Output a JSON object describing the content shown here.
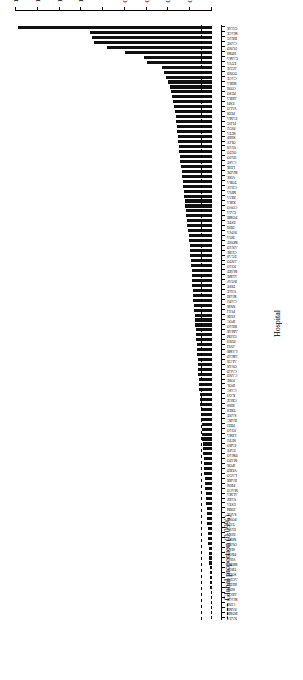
{
  "chart_data": {
    "type": "bar",
    "orientation": "horizontal",
    "title": "",
    "subtitle": "",
    "xlabel": "%",
    "ylabel": "Hospital",
    "xlim": [
      0,
      1.8
    ],
    "x_ticks": [
      "0",
      "0.2",
      "0.4",
      "0.6",
      "0.8",
      "1",
      "1.2",
      "1.4",
      "1.6",
      "1.8"
    ],
    "x_tick_values": [
      0,
      0.2,
      0.4,
      0.6,
      0.8,
      1.0,
      1.2,
      1.4,
      1.6,
      1.8
    ],
    "grid": false,
    "legend_position": "top-left",
    "reference_line": {
      "label": "Global proportion (0.09%)",
      "value": 0.09,
      "style": "dashed",
      "color": "#000000"
    },
    "legend": [
      {
        "label": "Global proportion (0.09%)",
        "style": "dashed",
        "color": "#000000"
      }
    ],
    "bar_color": "#111111",
    "categories": [
      "GUAR",
      "MACE",
      "BRAG",
      "CANT",
      "FUND",
      "HPMI",
      "GAMA",
      "ETVA",
      "AGUE",
      "TOND",
      "CACE",
      "MIRA",
      "CONI",
      "PESO",
      "ABRA",
      "ESPI",
      "VALO",
      "PEDI",
      "FAMA",
      "FLEG",
      "PIGU",
      "SETA",
      "SERP",
      "OLIV",
      "VIAN",
      "OLTO",
      "HUJO",
      "CAST",
      "LEIR",
      "MADE",
      "VISE",
      "TORA",
      "CHAV",
      "MFIA",
      "BEJA",
      "XIRA",
      "COVO",
      "GAIA",
      "POMB",
      "ESTE",
      "DINI",
      "NOVA",
      "BOA",
      "MONT",
      "ANAD",
      "CUBE",
      "EGAS",
      "ANTO",
      "JOAO",
      "MART",
      "ALME",
      "BOAV",
      "DIST",
      "VALE",
      "MARI",
      "CAPU",
      "SNIR",
      "PULI",
      "FEIR",
      "IPOC",
      "BRAO",
      "AMAR",
      "GUIM",
      "PINH",
      "AVEI",
      "LAMB",
      "AMAD",
      "ALCB",
      "OVAR",
      "CALD",
      "CAND",
      "JOSE",
      "IPOL",
      "CASC",
      "XAVI",
      "CRUZ",
      "BISS",
      "TRES",
      "SANT",
      "BARC",
      "PREI",
      "JOAO2",
      "LIMA",
      "SETU",
      "FARO",
      "FAFE",
      "PMAO",
      "MATO",
      "IPOR",
      "VERD",
      "LAGO",
      "BARR",
      "PBNI",
      "MACO",
      "ALMA",
      "VARZ",
      "ESTA",
      "HBM",
      "SAGR",
      "PONT",
      "TAVI",
      "ELVA",
      "NISA",
      "MOIT",
      "OURE",
      "SEIA",
      "PROE",
      "VILA",
      "MEDA",
      "TROF",
      "SOUR",
      "AGUD",
      "REDO",
      "SINE",
      "ARCO",
      "MACE2",
      "CINF",
      "PAMP",
      "BOMB",
      "NAZA"
    ],
    "values": [
      1.78,
      1.12,
      1.1,
      1.08,
      0.96,
      0.8,
      0.62,
      0.6,
      0.46,
      0.44,
      0.42,
      0.4,
      0.39,
      0.38,
      0.37,
      0.36,
      0.35,
      0.34,
      0.335,
      0.33,
      0.325,
      0.32,
      0.315,
      0.31,
      0.305,
      0.3,
      0.295,
      0.29,
      0.285,
      0.28,
      0.275,
      0.27,
      0.265,
      0.26,
      0.255,
      0.25,
      0.245,
      0.24,
      0.235,
      0.23,
      0.225,
      0.22,
      0.215,
      0.21,
      0.205,
      0.2,
      0.198,
      0.195,
      0.19,
      0.188,
      0.185,
      0.182,
      0.18,
      0.176,
      0.172,
      0.17,
      0.167,
      0.164,
      0.16,
      0.157,
      0.154,
      0.15,
      0.147,
      0.144,
      0.141,
      0.138,
      0.135,
      0.132,
      0.13,
      0.127,
      0.124,
      0.121,
      0.118,
      0.115,
      0.112,
      0.11,
      0.107,
      0.104,
      0.101,
      0.098,
      0.095,
      0.092,
      0.09,
      0.088,
      0.085,
      0.082,
      0.08,
      0.077,
      0.074,
      0.072,
      0.069,
      0.066,
      0.063,
      0.06,
      0.058,
      0.055,
      0.052,
      0.05,
      0.047,
      0.045,
      0.042,
      0.04,
      0.038,
      0.035,
      0.033,
      0.03,
      0.028,
      0.026,
      0.024,
      0.022,
      0.02,
      0.018,
      0.016,
      0.014,
      0.012,
      0.01,
      0.008,
      0.006,
      0.004,
      0.002
    ],
    "category_labels_visible": [
      "GUAR",
      "MACE",
      "BRAG",
      "CANT",
      "FUND",
      "HPMI",
      "GAMA",
      "ETVA",
      "AGUE",
      "TOND",
      "CACE",
      "MIRA",
      "CONI",
      "PESO",
      "ABRA",
      "ESPI",
      "VALO",
      "PEDI",
      "FAMA",
      "FLEG",
      "PIGU",
      "SETA",
      "SERP",
      "OLIV",
      "VIAN",
      "OLTO",
      "HUJO",
      "CAST",
      "LEIR",
      "MADE",
      "VISE",
      "TORA",
      "CHAV",
      "MFIA",
      "BEJA",
      "XIRA",
      "COVO",
      "GAIA",
      "POMB",
      "ESTE",
      "DINI",
      "NOVA",
      "BOA",
      "MONT",
      "ANAD",
      "CUBE",
      "EGAS",
      "ANTO",
      "JOAO",
      "MART",
      "ALME",
      "BOAV",
      "DIST",
      "VALE",
      "MARI",
      "CAPU",
      "SNIR",
      "PULI",
      "FEIR",
      "IPOC",
      "BRAO",
      "AMAR",
      "GUIM",
      "PINH",
      "AVEI",
      "LAMB",
      "AMAD",
      "ALCB",
      "OVAR",
      "CALD",
      "CAND",
      "JOSE",
      "IPOL",
      "CASC",
      "XAVI",
      "CRUZ",
      "BISS",
      "TRES",
      "SANT",
      "BARC",
      "PREI",
      "JOAO",
      "LIMA",
      "SETU",
      "FARO",
      "FAFE",
      "PMAO",
      "MATO",
      "IPOR",
      "VERD",
      "LAGO",
      "BARR",
      "PBNI",
      "MACO",
      "ALMA",
      "VARZ",
      "ESTA",
      "HBM",
      "SAGR",
      "PONT",
      "TAVI",
      "ELVA",
      "NISA",
      "MOIT",
      "OURE",
      "SEIA",
      "PROE",
      "VILA",
      "MEDA",
      "TROF",
      "SOUR",
      "AGUD",
      "REDO",
      "SINE",
      "ARCO",
      "MACE",
      "CINF",
      "PAMP",
      "BOMB",
      "NAZA"
    ]
  },
  "axis": {
    "value_axis_title": "%",
    "category_axis_title": "Hospital"
  },
  "legend": {
    "reference_label": "Global proportion (0.09%)"
  }
}
